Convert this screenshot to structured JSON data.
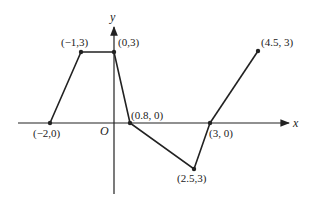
{
  "diagram": {
    "type": "piecewise-linear-graph",
    "axes": {
      "x_label": "x",
      "y_label": "y",
      "origin_label": "O"
    },
    "points": [
      {
        "id": "p1",
        "label": "(−2,0)",
        "x": -2,
        "y": 0
      },
      {
        "id": "p2",
        "label": "(−1,3)",
        "x": -1,
        "y": 3
      },
      {
        "id": "p3",
        "label": "(0,3)",
        "x": 0,
        "y": 3
      },
      {
        "id": "p4",
        "label": "(0.8, 0)",
        "x": 0.8,
        "y": 0
      },
      {
        "id": "p5",
        "label": "(2.5,3)",
        "x": 2.5,
        "y": -3
      },
      {
        "id": "p6",
        "label": "(3, 0)",
        "x": 3,
        "y": 0
      },
      {
        "id": "p7",
        "label": "(4.5, 3)",
        "x": 4.5,
        "y": 3
      }
    ],
    "colors": {
      "line": "#222222",
      "background": "#ffffff"
    }
  }
}
